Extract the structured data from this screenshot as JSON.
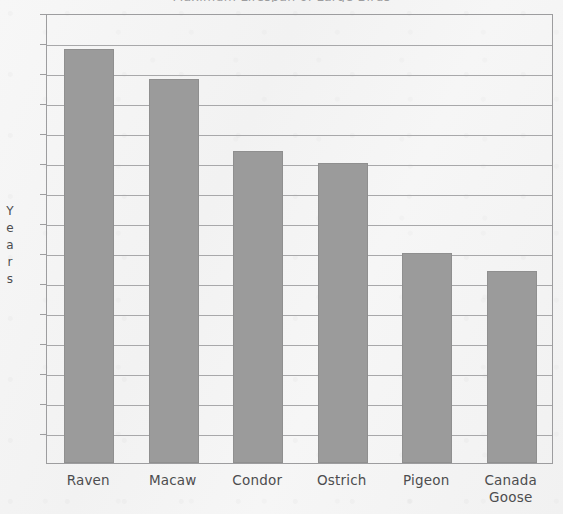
{
  "chart_data": {
    "type": "bar",
    "title": "Maximum Lifespan of Large Birds",
    "xlabel": "",
    "ylabel": "Years",
    "categories": [
      "Raven",
      "Macaw",
      "Condor",
      "Ostrich",
      "Pigeon",
      "Canada Goose"
    ],
    "values": [
      69,
      64,
      52,
      50,
      35,
      32
    ],
    "ylim": [
      0,
      75
    ],
    "ytick_step": 5,
    "yticks": [
      0,
      5,
      10,
      15,
      20,
      25,
      30,
      35,
      40,
      45,
      50,
      55,
      60,
      65,
      70,
      75
    ],
    "ytick_labels": [
      "0",
      "5",
      "10",
      "15",
      "20",
      "25",
      "30",
      "35",
      "40",
      "45",
      "50",
      "55",
      "60",
      "65",
      "70",
      "75"
    ],
    "grid": true,
    "legend": false,
    "legend_position": "none",
    "bar_color": "#9b9b9b",
    "grid_color": "#a8a8aa",
    "axis_color": "#9d9d9f",
    "background_color": "#f4f4f4",
    "text_color": "#4d4d4f"
  },
  "axis": {
    "y_title_letters": [
      "Y",
      "e",
      "a",
      "r",
      "s"
    ]
  }
}
